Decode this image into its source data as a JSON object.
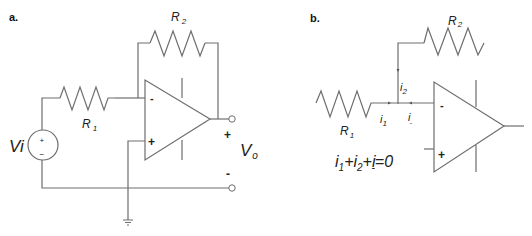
{
  "panel_a": {
    "label": "a.",
    "r1_label": "R",
    "r1_sub": "1",
    "r2_label": "R",
    "r2_sub": "2",
    "source_label": "Vi",
    "source_plus": "+",
    "source_minus": "−",
    "opamp_minus": "-",
    "opamp_plus": "+",
    "out_plus": "+",
    "out_minus": "-",
    "vo_label": "V",
    "vo_sub": "o"
  },
  "panel_b": {
    "label": "b.",
    "r1_label": "R",
    "r1_sub": "1",
    "r2_label": "R",
    "r2_sub": "2",
    "i1_label": "i",
    "i1_sub": "1",
    "i2_label": "i",
    "i2_sub": "2",
    "iminus_label": "i",
    "iminus_sub": "-",
    "opamp_minus": "-",
    "opamp_plus": "+",
    "equation": {
      "parts": [
        "i",
        "1",
        "+i",
        "2",
        "+i",
        "-",
        "=0"
      ]
    }
  }
}
